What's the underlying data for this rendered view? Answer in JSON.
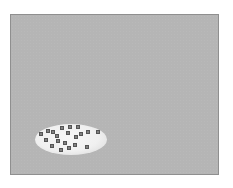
{
  "diagram": {
    "frame": {
      "fill": "#b5b5b5",
      "border": "#8f8f8f"
    },
    "region": {
      "shape": "ellipse",
      "fill": "#f2f2f2",
      "center": [
        71,
        139
      ],
      "radii": [
        36,
        15.5
      ]
    },
    "markers": {
      "icon": "x-marker-icon",
      "color": "#555555",
      "count": 20,
      "points": [
        [
          41,
          134
        ],
        [
          48,
          131
        ],
        [
          53,
          132
        ],
        [
          62,
          128
        ],
        [
          70,
          127
        ],
        [
          78,
          127
        ],
        [
          68,
          133
        ],
        [
          57,
          136
        ],
        [
          76,
          137
        ],
        [
          81,
          134
        ],
        [
          88,
          132
        ],
        [
          98,
          132
        ],
        [
          46,
          140
        ],
        [
          58,
          141
        ],
        [
          65,
          143
        ],
        [
          75,
          145
        ],
        [
          52,
          146
        ],
        [
          61,
          150
        ],
        [
          69,
          148
        ],
        [
          87,
          147
        ]
      ]
    }
  }
}
